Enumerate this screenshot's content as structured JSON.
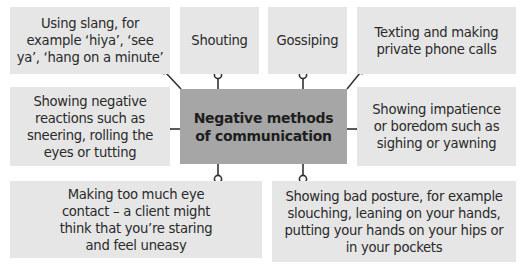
{
  "diagram": {
    "type": "spider-diagram",
    "center": {
      "label": "Negative methods of communication"
    },
    "nodes": [
      {
        "id": "slang",
        "label": "Using slang, for example ‘hiya’, ‘see ya’, ‘hang on a minute’"
      },
      {
        "id": "shouting",
        "label": "Shouting"
      },
      {
        "id": "gossiping",
        "label": "Gossiping"
      },
      {
        "id": "texting",
        "label": "Texting and making private phone calls"
      },
      {
        "id": "negative-reactions",
        "label": "Showing negative reactions such as sneering, rolling the eyes or tutting"
      },
      {
        "id": "impatience",
        "label": "Showing impatience or boredom such as sighing or yawning"
      },
      {
        "id": "eye-contact",
        "label": "Making too much eye contact – a client might think that you’re staring and feel uneasy"
      },
      {
        "id": "posture",
        "label": "Showing bad posture, for example slouching, leaning on your hands, putting your hands on your hips or in your pockets"
      }
    ],
    "colors": {
      "node_fill": "#e6e6e6",
      "center_fill": "#a6a6a6",
      "connector": "#333333",
      "text": "#2a2a2a"
    }
  }
}
